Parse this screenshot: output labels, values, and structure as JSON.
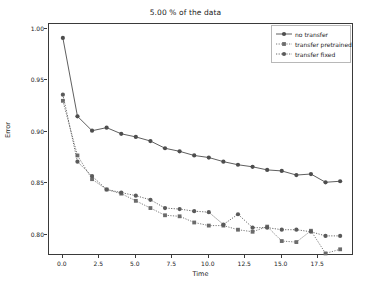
{
  "chart_data": {
    "type": "line",
    "title": "5.00 % of the data",
    "xlabel": "Time",
    "ylabel": "Error",
    "xlim": [
      -0.95,
      19.95
    ],
    "ylim": [
      0.7795,
      1.0045
    ],
    "xticks": [
      "0.0",
      "2.5",
      "5.0",
      "7.5",
      "10.0",
      "12.5",
      "15.0",
      "17.5"
    ],
    "xtick_values": [
      0.0,
      2.5,
      5.0,
      7.5,
      10.0,
      12.5,
      15.0,
      17.5
    ],
    "yticks": [
      "1.00",
      "0.95",
      "0.90",
      "0.85",
      "0.80"
    ],
    "ytick_values": [
      1.0,
      0.95,
      0.9,
      0.85,
      0.8
    ],
    "grid": false,
    "legend_position": "upper right",
    "x": [
      0,
      1,
      2,
      3,
      4,
      5,
      6,
      7,
      8,
      9,
      10,
      11,
      12,
      13,
      14,
      15,
      16,
      17,
      18,
      19
    ],
    "series": [
      {
        "name": "no transfer",
        "linestyle": "solid",
        "marker": "circle",
        "color": "#4d4d4d",
        "values": [
          0.991,
          0.915,
          0.901,
          0.904,
          0.898,
          0.895,
          0.891,
          0.884,
          0.881,
          0.877,
          0.875,
          0.871,
          0.868,
          0.866,
          0.863,
          0.862,
          0.858,
          0.859,
          0.851,
          0.852
        ]
      },
      {
        "name": "transfer pretrained",
        "linestyle": "dotted",
        "marker": "square",
        "color": "#6b6b6b",
        "values": [
          0.93,
          0.877,
          0.854,
          0.844,
          0.84,
          0.833,
          0.826,
          0.819,
          0.818,
          0.812,
          0.809,
          0.809,
          0.805,
          0.803,
          0.808,
          0.794,
          0.793,
          0.804,
          0.782,
          0.786
        ]
      },
      {
        "name": "transfer fixed",
        "linestyle": "dotted",
        "marker": "circle",
        "color": "#5a5a5a",
        "values": [
          0.936,
          0.871,
          0.857,
          0.844,
          0.841,
          0.838,
          0.834,
          0.826,
          0.825,
          0.823,
          0.822,
          0.81,
          0.82,
          0.807,
          0.807,
          0.805,
          0.805,
          0.803,
          0.799,
          0.799
        ]
      }
    ]
  },
  "legend": {
    "items": [
      {
        "label": "no transfer"
      },
      {
        "label": "transfer pretrained"
      },
      {
        "label": "transfer fixed"
      }
    ]
  }
}
